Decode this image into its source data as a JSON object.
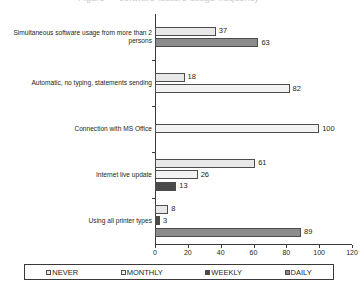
{
  "title_faint": "Figure — software feature usage frequency",
  "chart_data": {
    "type": "bar",
    "orientation": "horizontal",
    "title": "",
    "xlabel": "",
    "ylabel": "",
    "xlim": [
      0,
      120
    ],
    "xticks": [
      0,
      20,
      40,
      60,
      80,
      100,
      120
    ],
    "grid": false,
    "legend_position": "bottom",
    "categories": [
      "Simultaneous software usage from more than 2\npersons",
      "Automatic, no typing, statements sending",
      "Connection with MS Office",
      "Internet live update",
      "Using all printer types"
    ],
    "series": [
      {
        "name": "NEVER",
        "color": "#e8e8e8",
        "values": [
          37,
          18,
          null,
          61,
          8
        ]
      },
      {
        "name": "MONTHLY",
        "color": "#f2f2f2",
        "values": [
          null,
          82,
          100,
          26,
          null
        ]
      },
      {
        "name": "WEEKLY",
        "color": "#4a4a4a",
        "values": [
          null,
          null,
          null,
          13,
          3
        ]
      },
      {
        "name": "DAILY",
        "color": "#8c8c8c",
        "values": [
          63,
          null,
          null,
          null,
          89
        ]
      }
    ]
  },
  "legend": {
    "items": [
      {
        "label": "NEVER",
        "color": "#e8e8e8"
      },
      {
        "label": "MONTHLY",
        "color": "#f2f2f2"
      },
      {
        "label": "WEEKLY",
        "color": "#4a4a4a"
      },
      {
        "label": "DAILY",
        "color": "#8c8c8c"
      }
    ]
  },
  "axis": {
    "tick_labels": [
      "0",
      "20",
      "40",
      "60",
      "80",
      "100",
      "120"
    ]
  }
}
